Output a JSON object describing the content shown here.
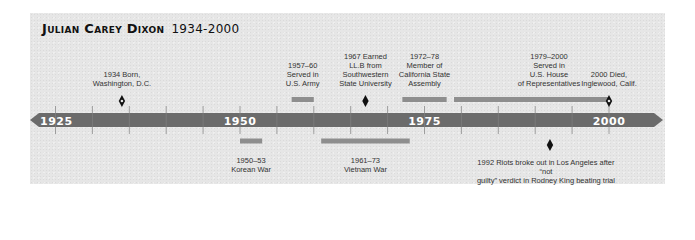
{
  "title": {
    "name": "Julian Carey Dixon",
    "years": "1934-2000"
  },
  "colors": {
    "panel": "#e6e6e6",
    "axis_bar": "#6b6b6b",
    "span_bar": "#8e8e8e",
    "marker": "#111111",
    "axis_text": "#ffffff"
  },
  "axis": {
    "start_year": 1922,
    "end_year": 2004,
    "tick_interval": 5,
    "labels": [
      "1925",
      "1950",
      "1975",
      "2000"
    ]
  },
  "events_above": [
    {
      "type": "point",
      "year": 1934,
      "marker": "open-diamond",
      "text": "1934 Born,\nWashington, D.C."
    },
    {
      "type": "span",
      "start": 1957,
      "end": 1960,
      "text": "1957–60\nServed in\nU.S. Army"
    },
    {
      "type": "point",
      "year": 1967,
      "marker": "diamond",
      "text": "1967 Earned\nLL.B from\nSouthwestern\nState University"
    },
    {
      "type": "span",
      "start": 1972,
      "end": 1978,
      "text": "1972–78\nMember of\nCalifornia State\nAssembly"
    },
    {
      "type": "span",
      "start": 1979,
      "end": 2000,
      "text": "1979–2000\nServed in\nU.S. House\nof Representatives"
    },
    {
      "type": "point",
      "year": 2000,
      "marker": "open-diamond",
      "text": "2000 Died,\nInglewood, Calif."
    }
  ],
  "events_below": [
    {
      "type": "span",
      "start": 1950,
      "end": 1953,
      "text": "1950–53\nKorean War"
    },
    {
      "type": "span",
      "start": 1961,
      "end": 1973,
      "text": "1961–73\nVietnam War"
    },
    {
      "type": "point",
      "year": 1992,
      "marker": "diamond",
      "text": "1992 Riots broke out in Los Angeles after “not\nguilty” verdict in Rodney King beating trial"
    }
  ]
}
